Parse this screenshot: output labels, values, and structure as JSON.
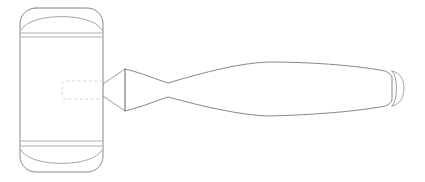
{
  "image": {
    "subject": "wooden mallet",
    "view": "side elevation line drawing",
    "style": "technical outline drawing, hidden lines dashed",
    "background_color": "#ffffff",
    "width": 425,
    "height": 182
  },
  "palette": {
    "outline": "#7a7a7a",
    "outline_soft": "#8d8d8d",
    "band": "#9a9a9a",
    "hidden": "#c9c9c9",
    "fill": "#ffffff"
  },
  "parts": {
    "head": {
      "name": "mallet head",
      "shape": "rounded-corner cylinder in profile",
      "left": 20,
      "right": 103,
      "top": 8,
      "bottom": 172,
      "corner_radius": 16
    },
    "band_top": {
      "name": "upper hoop band",
      "y_upper": 33,
      "y_lower": 37
    },
    "band_bottom": {
      "name": "lower hoop band",
      "y_upper": 141,
      "y_lower": 146
    },
    "tenon": {
      "name": "hidden tenon inside head",
      "left": 62,
      "right": 103,
      "top": 81,
      "bottom": 99,
      "line_style": "dashed hidden line"
    },
    "neck": {
      "name": "flared handle neck wedge",
      "left": 103,
      "right": 125,
      "narrow_top": 84,
      "narrow_bottom": 96,
      "wide_top": 69,
      "wide_bottom": 111
    },
    "handle": {
      "name": "spindle handle",
      "start": 125,
      "end": 404,
      "waist_x": 168,
      "waist_top": 83,
      "waist_bottom": 97,
      "swell_x": 268,
      "swell_top": 62,
      "swell_bottom": 116,
      "cap_x": 392,
      "cap_top": 71,
      "cap_bottom": 106
    },
    "end_cap": {
      "name": "handle end cap face",
      "arc_x": 392,
      "arc_top": 71,
      "arc_bottom": 106
    }
  }
}
